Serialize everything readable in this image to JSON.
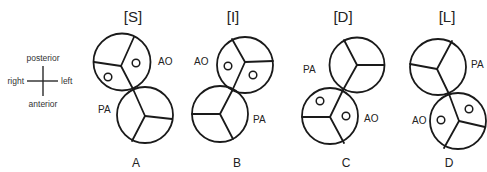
{
  "compass": {
    "top": "posterior",
    "bottom": "anterior",
    "left_side": "right",
    "right_side": "left"
  },
  "panels": [
    {
      "id": "A",
      "header": "[S]",
      "footer": "A",
      "ao_label": "AO",
      "pa_label": "PA",
      "ao_position": "top (posterior), slightly left",
      "pa_position": "bottom (anterior), slightly right"
    },
    {
      "id": "B",
      "header": "[I]",
      "footer": "B",
      "ao_label": "AO",
      "pa_label": "PA",
      "ao_position": "top (posterior), slightly right",
      "pa_position": "bottom (anterior), slightly left"
    },
    {
      "id": "C",
      "header": "[D]",
      "footer": "C",
      "ao_label": "AO",
      "pa_label": "PA",
      "ao_position": "bottom (anterior), slightly left",
      "pa_position": "top (posterior), slightly right"
    },
    {
      "id": "D",
      "header": "[L]",
      "footer": "D",
      "ao_label": "AO",
      "pa_label": "PA",
      "ao_position": "bottom (anterior), slightly right",
      "pa_position": "top (posterior), slightly left"
    }
  ],
  "colors": {
    "stroke": "#1a1a1a",
    "text": "#222222",
    "background": "#ffffff"
  }
}
